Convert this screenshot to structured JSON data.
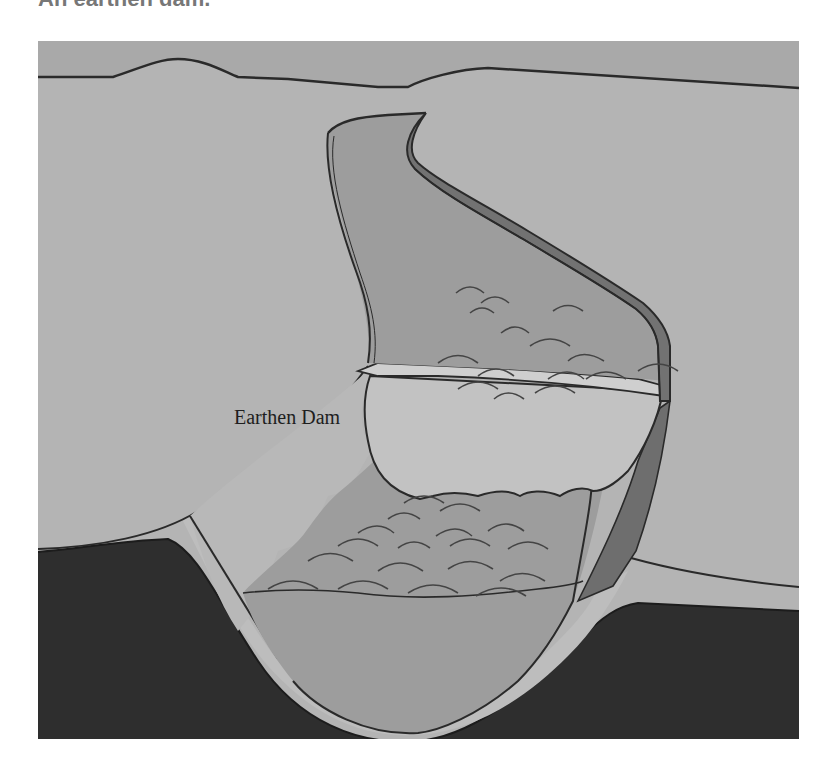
{
  "caption": "An earthen dam.",
  "figure": {
    "labels": {
      "dam": "Earthen Dam"
    },
    "colors": {
      "sky": "#a9a9a9",
      "land": "#b4b4b4",
      "reservoir": "#9d9d9d",
      "dam_face": "#bcbcbc",
      "dam_crest": "#c8c8c8",
      "bank_dark": "#6e6e6e",
      "bedrock": "#2e2e2e",
      "valley_rim": "#bdbdbd",
      "outline": "#2a2a2a"
    },
    "regions": [
      "sky",
      "left-hillside",
      "right-hillside",
      "upstream-reservoir",
      "dam-crest",
      "dam-downstream-face",
      "downstream-water",
      "valley-floor-rim",
      "bedrock"
    ]
  }
}
